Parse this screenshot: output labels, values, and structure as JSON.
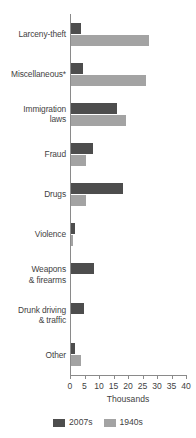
{
  "chart_data": {
    "type": "bar",
    "orientation": "horizontal",
    "title": "",
    "xlabel": "Thousands",
    "ylabel": "",
    "xlim": [
      0,
      40
    ],
    "xticks": [
      0,
      5,
      10,
      15,
      20,
      25,
      30,
      35,
      40
    ],
    "xtick_labels": [
      "0",
      "5",
      "10",
      "15",
      "20",
      "25",
      "30",
      "35",
      "40"
    ],
    "grid": false,
    "legend_position": "bottom",
    "categories": [
      "Larceny-theft",
      "Miscellaneous*",
      "Immigration laws",
      "Fraud",
      "Drugs",
      "Violence",
      "Weapons & firearms",
      "Drunk driving & traffic",
      "Other"
    ],
    "category_lines": [
      [
        "Larceny-theft"
      ],
      [
        "Miscellaneous*"
      ],
      [
        "Immigration",
        "laws"
      ],
      [
        "Fraud"
      ],
      [
        "Drugs"
      ],
      [
        "Violence"
      ],
      [
        "Weapons",
        "& firearms"
      ],
      [
        "Drunk driving",
        "& traffic"
      ],
      [
        "Other"
      ]
    ],
    "series": [
      {
        "name": "2007s",
        "color": "#4d4d4d",
        "values": [
          3.5,
          4.0,
          16.0,
          7.5,
          18.0,
          1.5,
          8.0,
          4.5,
          1.5
        ]
      },
      {
        "name": "1940s",
        "color": "#a3a3a3",
        "values": [
          27.0,
          26.0,
          19.0,
          5.0,
          5.0,
          0.8,
          0.0,
          0.0,
          3.5
        ]
      }
    ]
  },
  "legend": {
    "items": [
      {
        "label": "2007s",
        "color": "#4d4d4d"
      },
      {
        "label": "1940s",
        "color": "#a3a3a3"
      }
    ]
  },
  "axis": {
    "x_title": "Thousands"
  }
}
